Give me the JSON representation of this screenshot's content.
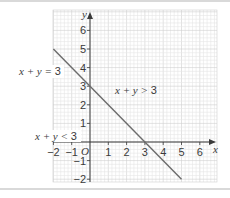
{
  "chart_data": {
    "type": "line",
    "title": "",
    "xlabel": "x",
    "ylabel": "y",
    "origin_label": "O",
    "xlim": [
      -2,
      6.5
    ],
    "ylim": [
      -2,
      6.8
    ],
    "grid": true,
    "x_ticks": [
      -2,
      -1,
      1,
      2,
      3,
      4,
      5,
      6
    ],
    "y_ticks": [
      -2,
      -1,
      1,
      2,
      3,
      4,
      5,
      6
    ],
    "x_tick_labels": [
      "−2",
      "−1",
      "1",
      "2",
      "3",
      "4",
      "5",
      "6"
    ],
    "y_tick_labels": [
      "−2",
      "−1",
      "1",
      "2",
      "3",
      "4",
      "5",
      "6"
    ],
    "series": [
      {
        "name": "x + y = 3",
        "x": [
          -2,
          5
        ],
        "y": [
          5,
          -2
        ],
        "color": "#6b6b6b"
      }
    ],
    "annotations": [
      {
        "text": "x + y = 3",
        "x": -4.6,
        "y": 4.0,
        "role": "line-label"
      },
      {
        "text": "x + y > 3",
        "x": 1.3,
        "y": 2.8,
        "role": "region-label"
      },
      {
        "text": "x + y < 3",
        "x": -3.6,
        "y": 0.35,
        "role": "region-label"
      }
    ]
  },
  "colors": {
    "grid_minor": "#e6e6e6",
    "grid_major": "#cfcfcf",
    "axis": "#3a3a3a",
    "line": "#6b6b6b",
    "frame": "#d9d9d9"
  },
  "labels": {
    "line_label": {
      "pre": "x + y = ",
      "num": "3"
    },
    "above_label": {
      "pre": "x + y > ",
      "num": "3"
    },
    "below_label": {
      "pre": "x + y < ",
      "num": "3"
    },
    "x_axis": "x",
    "y_axis": "y",
    "origin": "O"
  }
}
